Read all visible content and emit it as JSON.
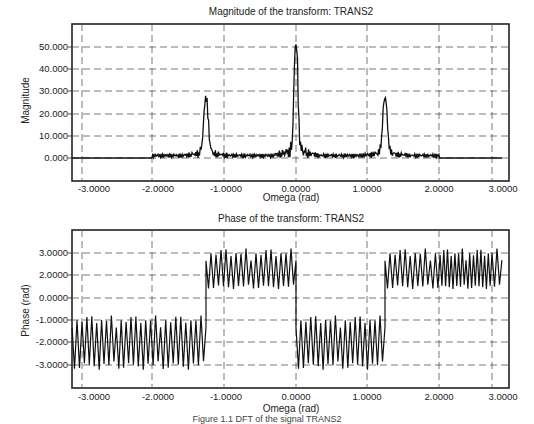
{
  "chart_data": [
    {
      "type": "line",
      "title": "Magnitude of the transform: TRANS2",
      "xlabel": "Omega (rad)",
      "ylabel": "Magnitude",
      "xlim": [
        -3.14,
        3.14
      ],
      "ylim": [
        -10,
        60
      ],
      "x_ticks": [
        "-3.0000",
        "-2.0000",
        "-1.0000",
        "0.0000",
        "1.0000",
        "2.0000",
        "3.0000"
      ],
      "y_ticks": [
        "50.000",
        "40.000",
        "30.000",
        "20.000",
        "10.000",
        "0.000"
      ],
      "grid": true,
      "series": [
        {
          "name": "Magnitude",
          "peaks": [
            {
              "x": -1.25,
              "y": 25
            },
            {
              "x": 0.0,
              "y": 50
            },
            {
              "x": 1.25,
              "y": 25
            }
          ],
          "baseline": 0,
          "noise_floor": 2,
          "nonzero_range": [
            -2.0,
            2.0
          ]
        }
      ]
    },
    {
      "type": "line",
      "title": "Phase of the transform: TRANS2",
      "xlabel": "Omega (rad)",
      "ylabel": "Phase (rad)",
      "xlim": [
        -3.14,
        3.14
      ],
      "ylim": [
        -4,
        4
      ],
      "x_ticks": [
        "-3.0000",
        "-2.0000",
        "-1.0000",
        "0.0000",
        "1.0000",
        "2.0000",
        "3.0000"
      ],
      "y_ticks": [
        "3.0000",
        "2.0000",
        "0.0000",
        "-1.0000",
        "-2.0000",
        "-3.0000"
      ],
      "grid": true,
      "series": [
        {
          "name": "Phase",
          "segments": [
            {
              "x_from": -3.14,
              "x_to": -1.25,
              "center": -2.0,
              "amplitude": 1.0
            },
            {
              "x_from": -1.25,
              "x_to": 0.0,
              "center": 2.0,
              "amplitude": 1.0
            },
            {
              "x_from": 0.0,
              "x_to": 1.25,
              "center": -2.0,
              "amplitude": 1.0
            },
            {
              "x_from": 1.25,
              "x_to": 3.14,
              "center": 2.0,
              "amplitude": 1.0
            }
          ]
        }
      ]
    }
  ],
  "caption": "Figure 1.1 DFT of the signal TRANS2"
}
